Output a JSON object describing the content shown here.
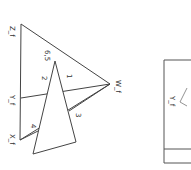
{
  "diagram": {
    "rotation_deg": 90,
    "left_figure": {
      "vertices": {
        "Zf": {
          "label": "Z_f",
          "x": 21,
          "y": 24
        },
        "Wf": {
          "label": "W_f",
          "x": 110,
          "y": 84
        },
        "Xf": {
          "label": "X_f",
          "x": 20,
          "y": 140
        },
        "Yf": {
          "label": "Y_f",
          "x": 21,
          "y": 98
        }
      },
      "inner_triangle": {
        "apex_label": "6,5",
        "apex": {
          "x": 55,
          "y": 61
        },
        "bottom_left": {
          "x": 33,
          "y": 154
        },
        "bottom_right": {
          "x": 76,
          "y": 142
        }
      },
      "region_labels": [
        "1",
        "2",
        "3",
        "4"
      ]
    },
    "right_figure": {
      "vertex_label": "Y_f",
      "stroke_color": "#555555"
    },
    "stroke_color": "#444444"
  }
}
